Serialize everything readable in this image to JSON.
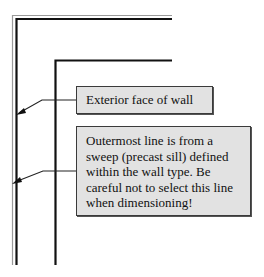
{
  "diagram": {
    "type": "wall-section annotation",
    "callouts": [
      {
        "id": "exterior-face",
        "text": "Exterior face of wall"
      },
      {
        "id": "sweep-warning",
        "text": "Outermost line is from a sweep (precast sill) defined within the wall type. Be careful not to select this line when dimensioning!"
      }
    ],
    "colors": {
      "callout_fill": "#e2e2e2",
      "callout_border": "#3a3a3a",
      "wall_line": "#111111",
      "sweep_line": "#9a9a9a"
    }
  }
}
